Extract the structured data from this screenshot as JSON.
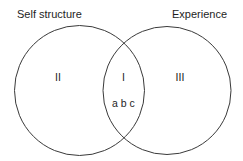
{
  "diagram": {
    "type": "venn",
    "sets": [
      {
        "id": "self",
        "label": "Self structure"
      },
      {
        "id": "experience",
        "label": "Experience"
      }
    ],
    "regions": {
      "self_only": "II",
      "overlap": "I",
      "overlap_items": "a b c",
      "experience_only": "III"
    },
    "colors": {
      "stroke": "#3a3a3a",
      "text": "#1e1e1e",
      "background": "#ffffff"
    }
  }
}
